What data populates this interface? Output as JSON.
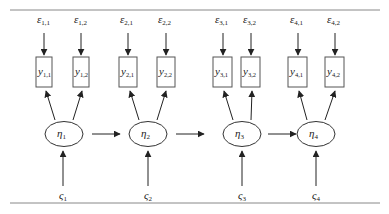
{
  "diagram": {
    "type": "structural-equation-path-diagram",
    "colors": {
      "line": "#333333",
      "rule": "#888888",
      "text": "#222222",
      "background": "#ffffff"
    },
    "error_terms": [
      {
        "symbol": "ε",
        "sub": "1,1"
      },
      {
        "symbol": "ε",
        "sub": "1,2"
      },
      {
        "symbol": "ε",
        "sub": "2,1"
      },
      {
        "symbol": "ε",
        "sub": "2,2"
      },
      {
        "symbol": "ε",
        "sub": "3,1"
      },
      {
        "symbol": "ε",
        "sub": "3,2"
      },
      {
        "symbol": "ε",
        "sub": "4,1"
      },
      {
        "symbol": "ε",
        "sub": "4,2"
      }
    ],
    "observed": [
      {
        "symbol": "y",
        "sub": "1,1"
      },
      {
        "symbol": "y",
        "sub": "1,2"
      },
      {
        "symbol": "y",
        "sub": "2,1"
      },
      {
        "symbol": "y",
        "sub": "2,2"
      },
      {
        "symbol": "y",
        "sub": "3,1"
      },
      {
        "symbol": "y",
        "sub": "3,2"
      },
      {
        "symbol": "y",
        "sub": "4,1"
      },
      {
        "symbol": "y",
        "sub": "4,2"
      }
    ],
    "latent": [
      {
        "symbol": "η",
        "sub": "1"
      },
      {
        "symbol": "η",
        "sub": "2"
      },
      {
        "symbol": "η",
        "sub": "3"
      },
      {
        "symbol": "η",
        "sub": "4"
      }
    ],
    "disturbances": [
      {
        "symbol": "ς",
        "sub": "1"
      },
      {
        "symbol": "ς",
        "sub": "2"
      },
      {
        "symbol": "ς",
        "sub": "3"
      },
      {
        "symbol": "ς",
        "sub": "4"
      }
    ],
    "paths": [
      "ε1,1→y1,1",
      "ε1,2→y1,2",
      "ε2,1→y2,1",
      "ε2,2→y2,2",
      "ε3,1→y3,1",
      "ε3,2→y3,2",
      "ε4,1→y4,1",
      "ε4,2→y4,2",
      "η1→y1,1",
      "η1→y1,2",
      "η2→y2,1",
      "η2→y2,2",
      "η3→y3,1",
      "η3→y3,2",
      "η4→y4,1",
      "η4→y4,2",
      "η1→η2",
      "η2→η3",
      "η3→η4",
      "ς1→η1",
      "ς2→η2",
      "ς3→η3",
      "ς4→η4"
    ]
  }
}
